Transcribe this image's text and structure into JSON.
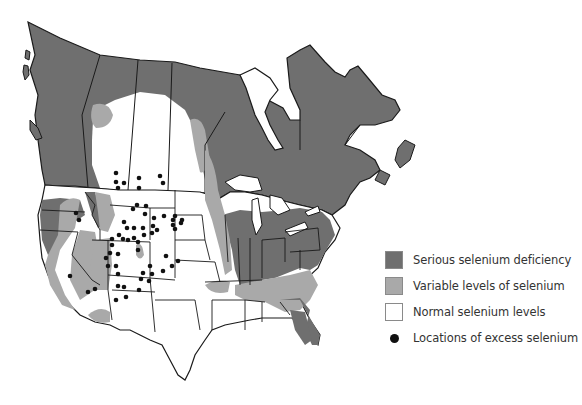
{
  "map": {
    "title": "Selenium levels in soils of North America",
    "region": "Canada and United States",
    "colors": {
      "serious_deficiency": "#6f6f6f",
      "variable_levels": "#a9a9a9",
      "normal_levels": "#ffffff",
      "excess_dot": "#111111",
      "borders": "#1a1a1a",
      "water": "#ffffff"
    }
  },
  "legend": {
    "items": [
      {
        "label": "Serious selenium deficiency",
        "kind": "swatch",
        "color": "#6f6f6f"
      },
      {
        "label": "Variable levels of selenium",
        "kind": "swatch",
        "color": "#a9a9a9"
      },
      {
        "label": "Normal selenium levels",
        "kind": "swatch",
        "color": "#ffffff"
      },
      {
        "label": "Locations of excess selenium",
        "kind": "dot",
        "color": "#111111"
      }
    ]
  }
}
